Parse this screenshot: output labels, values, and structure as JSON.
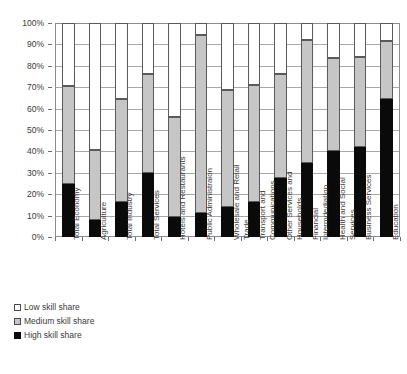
{
  "chart_data": {
    "type": "bar",
    "stacked": true,
    "title": "",
    "subtitle": "",
    "xlabel": "",
    "ylabel": "",
    "ylim": [
      0,
      100
    ],
    "ytick_labels": [
      "0%",
      "10%",
      "20%",
      "30%",
      "40%",
      "50%",
      "60%",
      "70%",
      "80%",
      "90%",
      "100%"
    ],
    "ytick_values": [
      0,
      10,
      20,
      30,
      40,
      50,
      60,
      70,
      80,
      90,
      100
    ],
    "grid": true,
    "legend_position": "bottom-left",
    "categories": [
      "Total Economy",
      "Agriculture",
      "Total Industry",
      "Total Services",
      "Hotels and Restaurants",
      "Public Administraion",
      "Wholesale and Retail Trade",
      "Transport and Communications",
      "Other Services and Households",
      "Financial Intermdediation",
      "Health and Social Services",
      "Business Services",
      "Education"
    ],
    "category_lines": [
      [
        "Total Economy"
      ],
      [
        "Agriculture"
      ],
      [
        "Total Industry"
      ],
      [
        "Total Services"
      ],
      [
        "Hotels and Restaurants"
      ],
      [
        "Public Administraion"
      ],
      [
        "Wholesale and Retail",
        "Trade"
      ],
      [
        "Transport and",
        "Communications"
      ],
      [
        "Other Services and",
        "Households"
      ],
      [
        "Financial",
        "Intermdediation"
      ],
      [
        "Health and Social",
        "Services"
      ],
      [
        "Business Services"
      ],
      [
        "Education"
      ]
    ],
    "series": [
      {
        "name": "High skill share",
        "color": "#0a0a0a",
        "values": [
          25,
          8,
          16.5,
          30,
          9.5,
          11,
          14,
          16.5,
          27.5,
          34.5,
          40,
          42,
          64.5
        ]
      },
      {
        "name": "Medium skill share",
        "color": "#c6c6c6",
        "values": [
          45.5,
          32.5,
          48,
          46,
          46.5,
          83.5,
          54.5,
          54.5,
          48.5,
          57.5,
          43.5,
          42,
          27
        ]
      },
      {
        "name": "Low skill share",
        "color": "#ffffff",
        "values": [
          29.5,
          59.5,
          35.5,
          24,
          44,
          5.5,
          31.5,
          29,
          24,
          8,
          16.5,
          16,
          8.5
        ]
      }
    ],
    "cumulative_tops": {
      "high": [
        25,
        8,
        16.5,
        30,
        9.5,
        11,
        14,
        16.5,
        27.5,
        34.5,
        40,
        42,
        64.5
      ],
      "high_plus_medium": [
        70.5,
        40.5,
        64.5,
        76,
        56,
        94.5,
        68.5,
        71,
        76,
        92,
        83.5,
        84,
        91.5
      ]
    }
  },
  "legend": {
    "items": [
      {
        "label": "Low skill share",
        "swatch": "sw-low"
      },
      {
        "label": "Medium skill share",
        "swatch": "sw-med"
      },
      {
        "label": "High skill share",
        "swatch": "sw-high"
      }
    ]
  }
}
